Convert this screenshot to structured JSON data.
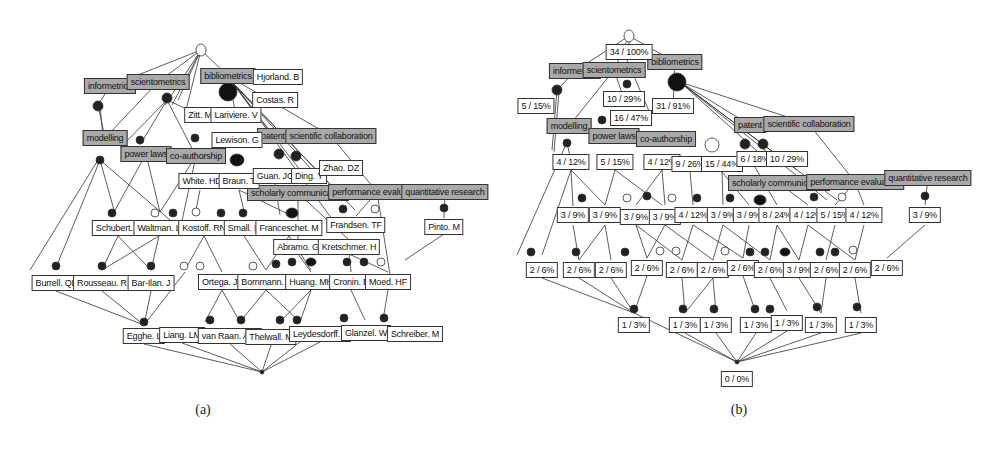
{
  "figure": {
    "panels": [
      {
        "id": "a",
        "caption": "(a)",
        "attribute_labels": [
          {
            "text": "informetrics",
            "x": 110,
            "y": 86
          },
          {
            "text": "scientometrics",
            "x": 158,
            "y": 82
          },
          {
            "text": "bibliometrics",
            "x": 228,
            "y": 76
          },
          {
            "text": "modelling",
            "x": 105,
            "y": 138
          },
          {
            "text": "power laws",
            "x": 146,
            "y": 154
          },
          {
            "text": "co-authorship",
            "x": 196,
            "y": 156
          },
          {
            "text": "patent",
            "x": 273,
            "y": 136
          },
          {
            "text": "scientific collaboration",
            "x": 331,
            "y": 136
          },
          {
            "text": "scholarly communication",
            "x": 298,
            "y": 193
          },
          {
            "text": "performance evaluation",
            "x": 377,
            "y": 192
          },
          {
            "text": "quantitative research",
            "x": 445,
            "y": 192
          }
        ],
        "object_labels": [
          {
            "text": "Hjorland. B",
            "x": 278,
            "y": 77
          },
          {
            "text": "Costas. R",
            "x": 275,
            "y": 100
          },
          {
            "text": "Zitt. M",
            "x": 200,
            "y": 115
          },
          {
            "text": "Lariviere. V",
            "x": 236,
            "y": 115
          },
          {
            "text": "Lewison. G",
            "x": 237,
            "y": 140
          },
          {
            "text": "White. HD",
            "x": 202,
            "y": 181
          },
          {
            "text": "Braun. T",
            "x": 239,
            "y": 181
          },
          {
            "text": "Guan. JC",
            "x": 275,
            "y": 176
          },
          {
            "text": "Ding. Y",
            "x": 309,
            "y": 176
          },
          {
            "text": "Zhao. DZ",
            "x": 341,
            "y": 168
          },
          {
            "text": "Schubert. A",
            "x": 118,
            "y": 228
          },
          {
            "text": "Waltman. L",
            "x": 159,
            "y": 228
          },
          {
            "text": "Kostoff. RN",
            "x": 204,
            "y": 228
          },
          {
            "text": "Small. H",
            "x": 244,
            "y": 228
          },
          {
            "text": "Franceschet. M",
            "x": 289,
            "y": 228
          },
          {
            "text": "Frandsen. TF",
            "x": 356,
            "y": 225
          },
          {
            "text": "Pinto. M",
            "x": 444,
            "y": 227
          },
          {
            "text": "Abramo. G",
            "x": 298,
            "y": 247
          },
          {
            "text": "Kretschmer. H",
            "x": 349,
            "y": 247
          },
          {
            "text": "Burrell. QL",
            "x": 56,
            "y": 283
          },
          {
            "text": "Rousseau. R",
            "x": 102,
            "y": 283
          },
          {
            "text": "Bar-Ilan. J",
            "x": 151,
            "y": 283
          },
          {
            "text": "Ortega. JL",
            "x": 222,
            "y": 282
          },
          {
            "text": "Bornmann. L",
            "x": 266,
            "y": 282
          },
          {
            "text": "Huang. MH",
            "x": 311,
            "y": 282
          },
          {
            "text": "Cronin. B",
            "x": 351,
            "y": 282
          },
          {
            "text": "Moed. HF",
            "x": 388,
            "y": 282
          },
          {
            "text": "Egghe. L",
            "x": 144,
            "y": 336
          },
          {
            "text": "Liang. LM",
            "x": 182,
            "y": 335
          },
          {
            "text": "van Raan. AFJ",
            "x": 230,
            "y": 336
          },
          {
            "text": "Thelwall. M",
            "x": 271,
            "y": 337
          },
          {
            "text": "Leydesdorff. L",
            "x": 320,
            "y": 334
          },
          {
            "text": "Glanzel. W",
            "x": 366,
            "y": 333
          },
          {
            "text": "Schreiber. M",
            "x": 415,
            "y": 334
          }
        ]
      },
      {
        "id": "b",
        "caption": "(b)",
        "attribute_labels": [
          {
            "text": "informetrics",
            "x": 78,
            "y": 71
          },
          {
            "text": "scientometrics",
            "x": 117,
            "y": 70
          },
          {
            "text": "bibliometrics",
            "x": 178,
            "y": 62
          },
          {
            "text": "modelling",
            "x": 72,
            "y": 126
          },
          {
            "text": "power laws",
            "x": 117,
            "y": 136
          },
          {
            "text": "co-authorship",
            "x": 169,
            "y": 139
          },
          {
            "text": "patent",
            "x": 253,
            "y": 125
          },
          {
            "text": "scientific collaboration",
            "x": 312,
            "y": 124
          },
          {
            "text": "scholarly communication",
            "x": 282,
            "y": 183
          },
          {
            "text": "performance evaluation",
            "x": 358,
            "y": 182
          },
          {
            "text": "quantitative research",
            "x": 431,
            "y": 178
          }
        ],
        "object_labels": [
          {
            "text": "34 / 100%",
            "x": 132,
            "y": 52
          },
          {
            "text": "5 / 15%",
            "x": 39,
            "y": 106
          },
          {
            "text": "10 / 29%",
            "x": 127,
            "y": 99
          },
          {
            "text": "16 / 47%",
            "x": 134,
            "y": 118
          },
          {
            "text": "31 / 91%",
            "x": 176,
            "y": 106
          },
          {
            "text": "4 / 12%",
            "x": 74,
            "y": 162
          },
          {
            "text": "5 / 15%",
            "x": 118,
            "y": 162
          },
          {
            "text": "4 / 12%",
            "x": 165,
            "y": 162
          },
          {
            "text": "9 / 26%",
            "x": 193,
            "y": 164
          },
          {
            "text": "15 / 44%",
            "x": 225,
            "y": 164
          },
          {
            "text": "6 / 18%",
            "x": 258,
            "y": 159
          },
          {
            "text": "10 / 29%",
            "x": 290,
            "y": 159
          },
          {
            "text": "3 / 9%",
            "x": 76,
            "y": 215
          },
          {
            "text": "3 / 9%",
            "x": 108,
            "y": 215
          },
          {
            "text": "3 / 9%",
            "x": 139,
            "y": 217
          },
          {
            "text": "3 / 9%",
            "x": 168,
            "y": 217
          },
          {
            "text": "4 / 12%",
            "x": 196,
            "y": 215
          },
          {
            "text": "3 / 9%",
            "x": 226,
            "y": 215
          },
          {
            "text": "3 / 9%",
            "x": 252,
            "y": 215
          },
          {
            "text": "8 / 24%",
            "x": 280,
            "y": 215
          },
          {
            "text": "4 / 12%",
            "x": 311,
            "y": 215
          },
          {
            "text": "5 / 15%",
            "x": 338,
            "y": 215
          },
          {
            "text": "4 / 12%",
            "x": 367,
            "y": 215
          },
          {
            "text": "3 / 9%",
            "x": 428,
            "y": 215
          },
          {
            "text": "2 / 6%",
            "x": 45,
            "y": 270
          },
          {
            "text": "2 / 6%",
            "x": 82,
            "y": 270
          },
          {
            "text": "2 / 6%",
            "x": 114,
            "y": 270
          },
          {
            "text": "2 / 6%",
            "x": 150,
            "y": 268
          },
          {
            "text": "2 / 6%",
            "x": 185,
            "y": 270
          },
          {
            "text": "2 / 6%",
            "x": 216,
            "y": 270
          },
          {
            "text": "2 / 6%",
            "x": 246,
            "y": 268
          },
          {
            "text": "2 / 6%",
            "x": 273,
            "y": 270
          },
          {
            "text": "3 / 9%",
            "x": 302,
            "y": 270
          },
          {
            "text": "2 / 6%",
            "x": 329,
            "y": 270
          },
          {
            "text": "2 / 6%",
            "x": 358,
            "y": 270
          },
          {
            "text": "2 / 6%",
            "x": 390,
            "y": 268
          },
          {
            "text": "1 / 3%",
            "x": 137,
            "y": 325
          },
          {
            "text": "1 / 3%",
            "x": 188,
            "y": 325
          },
          {
            "text": "1 / 3%",
            "x": 219,
            "y": 325
          },
          {
            "text": "1 / 3%",
            "x": 259,
            "y": 325
          },
          {
            "text": "1 / 3%",
            "x": 290,
            "y": 323
          },
          {
            "text": "1 / 3%",
            "x": 324,
            "y": 325
          },
          {
            "text": "1 / 3%",
            "x": 364,
            "y": 325
          },
          {
            "text": "0 / 0%",
            "x": 240,
            "y": 379
          }
        ]
      }
    ]
  },
  "colors": {
    "attribute_fill": "#a9a9a9",
    "object_fill": "#ffffff",
    "border": "#333333",
    "edge": "#333333",
    "node_dark": "#111111"
  }
}
